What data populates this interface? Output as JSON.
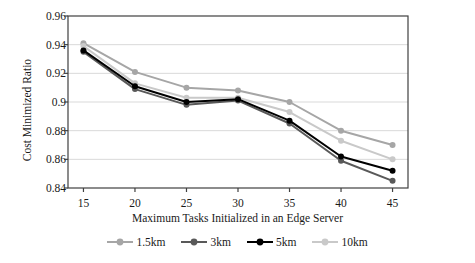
{
  "chart_data": {
    "type": "line",
    "title": "",
    "xlabel": "Maximum Tasks Initialized in an Edge Server",
    "ylabel": "Cost Minimized Ratio",
    "x": [
      15,
      20,
      25,
      30,
      35,
      40,
      45
    ],
    "xticklabels": [
      "15",
      "20",
      "25",
      "30",
      "35",
      "40",
      "45"
    ],
    "yticklabels": [
      "0.96",
      "0.94",
      "0.92",
      "0.9",
      "0.88",
      "0.86",
      "0.84"
    ],
    "yticks": [
      0.96,
      0.94,
      0.92,
      0.9,
      0.88,
      0.86,
      0.84
    ],
    "ylim": [
      0.84,
      0.96
    ],
    "xlim": [
      13.5,
      46.5
    ],
    "grid": "horizontal",
    "legend_position": "bottom",
    "series": [
      {
        "name": "1.5km",
        "color": "#a6a6a6",
        "values": [
          0.941,
          0.921,
          0.91,
          0.908,
          0.9,
          0.88,
          0.87
        ]
      },
      {
        "name": "3km",
        "color": "#595959",
        "values": [
          0.935,
          0.909,
          0.898,
          0.901,
          0.885,
          0.859,
          0.845
        ]
      },
      {
        "name": "5km",
        "color": "#000000",
        "values": [
          0.936,
          0.911,
          0.9,
          0.902,
          0.887,
          0.862,
          0.852
        ]
      },
      {
        "name": "10km",
        "color": "#c9c9c9",
        "values": [
          0.939,
          0.913,
          0.903,
          0.903,
          0.893,
          0.873,
          0.86
        ]
      }
    ]
  },
  "axes": {
    "frame_color": "#404040",
    "grid_color": "#d9d9d9"
  }
}
